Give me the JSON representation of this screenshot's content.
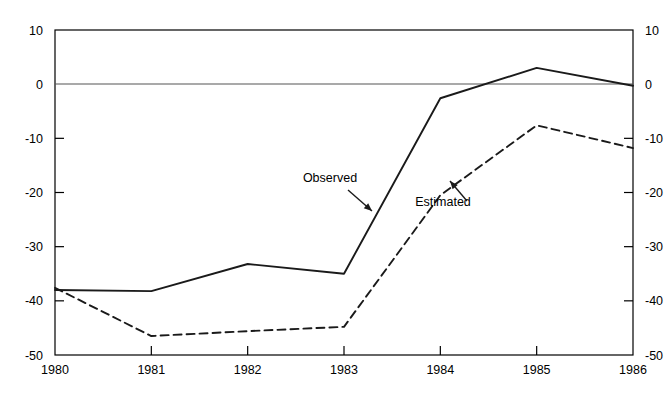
{
  "chart_data": {
    "type": "line",
    "title": "",
    "subtitle": "",
    "xlabel": "",
    "ylabel": "",
    "xlim": [
      1980,
      1986
    ],
    "ylim": [
      -50,
      10
    ],
    "xticks": [
      "1980",
      "1981",
      "1982",
      "1983",
      "1984",
      "1985",
      "1986"
    ],
    "yticks": [
      "10",
      "0",
      "-10",
      "-20",
      "-30",
      "-40",
      "-50"
    ],
    "yticks_right": [
      "10",
      "0",
      "-10",
      "-20",
      "-30",
      "-40",
      "-50"
    ],
    "grid": false,
    "zero_line": true,
    "legend": "inline-annotations",
    "x": [
      1980,
      1981,
      1982,
      1983,
      1984,
      1985,
      1986
    ],
    "series": [
      {
        "name": "Observed",
        "style": "solid",
        "color": "#1a1a1a",
        "values": [
          -38,
          -38.2,
          -33.2,
          -35,
          -2.6,
          3,
          -0.3
        ]
      },
      {
        "name": "Estimated",
        "style": "dashed",
        "color": "#1a1a1a",
        "values": [
          -37.6,
          -46.5,
          -45.6,
          -44.8,
          -20.5,
          -7.6,
          -11.8
        ]
      }
    ],
    "annotations": [
      {
        "text": "Observed",
        "x_px": 330,
        "y_px": 182,
        "arrow_from_px": [
          348,
          190
        ],
        "arrow_to_px": [
          372,
          211
        ]
      },
      {
        "text": "Estimated",
        "x_px": 443,
        "y_px": 206,
        "arrow_from_px": [
          467,
          201
        ],
        "arrow_to_px": [
          450,
          181
        ]
      }
    ]
  },
  "axes": {
    "left_axis_name": "left-value-axis",
    "right_axis_name": "right-value-axis",
    "bottom_axis_name": "year-axis"
  },
  "colors": {
    "background": "#ffffff",
    "ink": "#1a1a1a",
    "axis": "#000000",
    "zero_line": "#555555"
  }
}
